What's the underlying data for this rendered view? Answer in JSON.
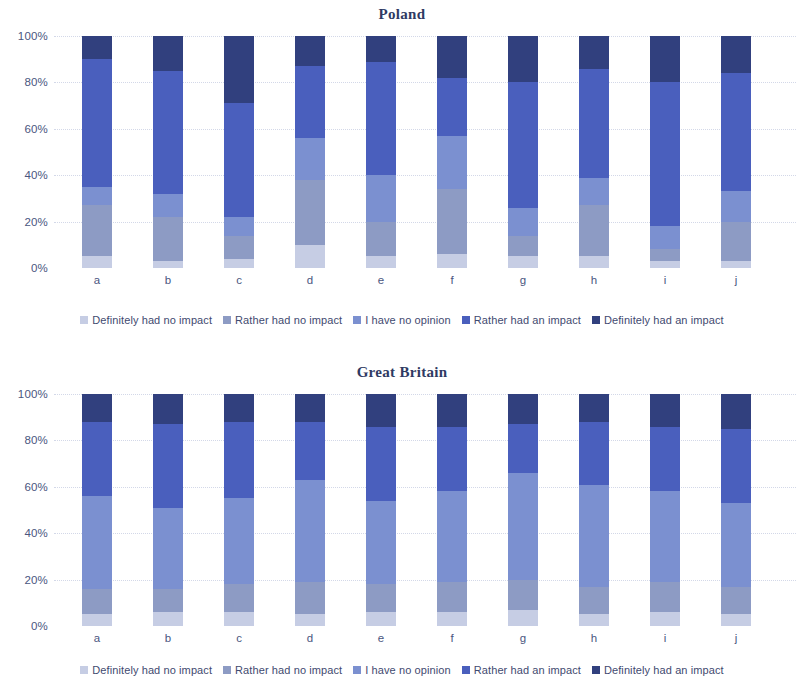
{
  "palette": {
    "definitely_no": "#c6cde4",
    "rather_no": "#8d9bc4",
    "no_opinion": "#7b90d0",
    "rather_yes": "#4a5fbd",
    "definitely_yes": "#31407e",
    "axis_text": "#4a5680",
    "title_text": "#2f3a63",
    "gridline": "#d3d8e8",
    "background": "#ffffff"
  },
  "legend": {
    "items": [
      {
        "label": "Definitely had no impact",
        "color_key": "definitely_no"
      },
      {
        "label": "Rather had no impact",
        "color_key": "rather_no"
      },
      {
        "label": "I have no opinion",
        "color_key": "no_opinion"
      },
      {
        "label": "Rather had an impact",
        "color_key": "rather_yes"
      },
      {
        "label": "Definitely had an impact",
        "color_key": "definitely_yes"
      }
    ]
  },
  "axis": {
    "ticks": [
      "0%",
      "20%",
      "40%",
      "60%",
      "80%",
      "100%"
    ],
    "tick_values": [
      0,
      20,
      40,
      60,
      80,
      100
    ]
  },
  "chart_data": [
    {
      "type": "bar",
      "stacked": true,
      "normalized_percent": true,
      "title": "Poland",
      "xlabel": "",
      "ylabel": "",
      "ylim": [
        0,
        100
      ],
      "yticks": [
        0,
        20,
        40,
        60,
        80,
        100
      ],
      "ytick_labels": [
        "0%",
        "20%",
        "40%",
        "60%",
        "80%",
        "100%"
      ],
      "grid": true,
      "legend_position": "bottom",
      "categories": [
        "a",
        "b",
        "c",
        "d",
        "e",
        "f",
        "g",
        "h",
        "i",
        "j"
      ],
      "series": [
        {
          "name": "Definitely had no impact",
          "color": "#c6cde4",
          "values": [
            5,
            3,
            4,
            10,
            5,
            6,
            5,
            5,
            3,
            3
          ]
        },
        {
          "name": "Rather had no impact",
          "color": "#8d9bc4",
          "values": [
            22,
            19,
            10,
            28,
            15,
            28,
            9,
            22,
            5,
            17
          ]
        },
        {
          "name": "I have no opinion",
          "color": "#7b90d0",
          "values": [
            8,
            10,
            8,
            18,
            20,
            23,
            12,
            12,
            10,
            13
          ]
        },
        {
          "name": "Rather had an impact",
          "color": "#4a5fbd",
          "values": [
            55,
            53,
            49,
            31,
            49,
            25,
            54,
            47,
            62,
            51
          ]
        },
        {
          "name": "Definitely had an impact",
          "color": "#31407e",
          "values": [
            10,
            15,
            29,
            13,
            11,
            18,
            20,
            14,
            20,
            16
          ]
        }
      ]
    },
    {
      "type": "bar",
      "stacked": true,
      "normalized_percent": true,
      "title": "Great Britain",
      "xlabel": "",
      "ylabel": "",
      "ylim": [
        0,
        100
      ],
      "yticks": [
        0,
        20,
        40,
        60,
        80,
        100
      ],
      "ytick_labels": [
        "0%",
        "20%",
        "40%",
        "60%",
        "80%",
        "100%"
      ],
      "grid": true,
      "legend_position": "bottom",
      "categories": [
        "a",
        "b",
        "c",
        "d",
        "e",
        "f",
        "g",
        "h",
        "i",
        "j"
      ],
      "series": [
        {
          "name": "Definitely had no impact",
          "color": "#c6cde4",
          "values": [
            5,
            6,
            6,
            5,
            6,
            6,
            7,
            5,
            6,
            5
          ]
        },
        {
          "name": "Rather had no impact",
          "color": "#8d9bc4",
          "values": [
            11,
            10,
            12,
            14,
            12,
            13,
            13,
            12,
            13,
            12
          ]
        },
        {
          "name": "I have no opinion",
          "color": "#7b90d0",
          "values": [
            40,
            35,
            37,
            44,
            36,
            39,
            46,
            44,
            39,
            36
          ]
        },
        {
          "name": "Rather had an impact",
          "color": "#4a5fbd",
          "values": [
            32,
            36,
            33,
            25,
            32,
            28,
            21,
            27,
            28,
            32
          ]
        },
        {
          "name": "Definitely had an impact",
          "color": "#31407e",
          "values": [
            12,
            13,
            12,
            12,
            14,
            14,
            13,
            12,
            14,
            15
          ]
        }
      ]
    }
  ]
}
